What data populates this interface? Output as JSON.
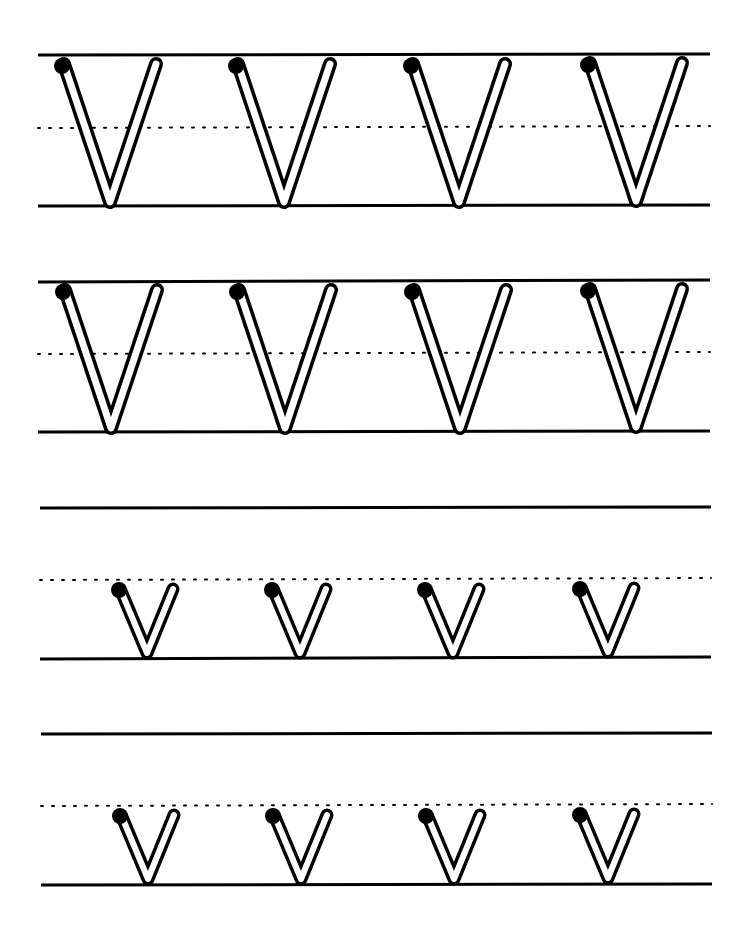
{
  "worksheet": {
    "type": "handwriting-practice",
    "letter_upper": "V",
    "letter_lower": "v",
    "colors": {
      "ink": "#000000",
      "paper": "#ffffff"
    },
    "rows": [
      {
        "case": "upper",
        "count": 4
      },
      {
        "case": "upper",
        "count": 4
      },
      {
        "case": "lower",
        "count": 4
      },
      {
        "case": "lower",
        "count": 4
      }
    ]
  }
}
